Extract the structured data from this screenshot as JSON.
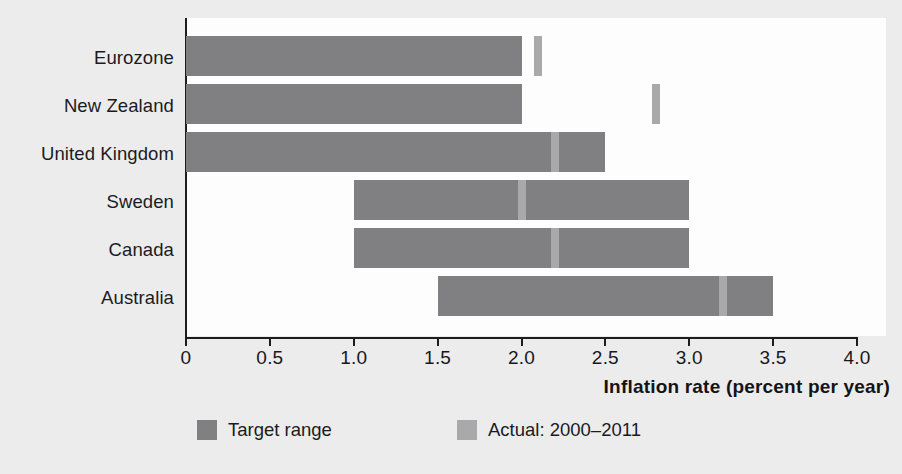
{
  "chart_data": {
    "type": "bar",
    "orientation": "horizontal",
    "title": "",
    "xlabel": "Inflation rate (percent per year)",
    "ylabel": "",
    "xlim": [
      0,
      4.0
    ],
    "xticks": [
      "0",
      "0.5",
      "1.0",
      "1.5",
      "2.0",
      "2.5",
      "3.0",
      "3.5",
      "4.0"
    ],
    "xtick_values": [
      0,
      0.5,
      1.0,
      1.5,
      2.0,
      2.5,
      3.0,
      3.5,
      4.0
    ],
    "grid": false,
    "legend_position": "bottom",
    "categories": [
      "Eurozone",
      "New Zealand",
      "United Kingdom",
      "Sweden",
      "Canada",
      "Australia"
    ],
    "series": [
      {
        "name": "Target range",
        "type": "range",
        "color": "#808082",
        "values": [
          {
            "category": "Eurozone",
            "low": 0.0,
            "high": 2.0
          },
          {
            "category": "New Zealand",
            "low": 0.0,
            "high": 2.0
          },
          {
            "category": "United Kingdom",
            "low": 0.0,
            "high": 2.5
          },
          {
            "category": "Sweden",
            "low": 1.0,
            "high": 3.0
          },
          {
            "category": "Canada",
            "low": 1.0,
            "high": 3.0
          },
          {
            "category": "Australia",
            "low": 1.5,
            "high": 3.5
          }
        ]
      },
      {
        "name": "Actual: 2000–2011",
        "type": "marker",
        "color": "#a9a9ab",
        "values": [
          {
            "category": "Eurozone",
            "value": 2.1
          },
          {
            "category": "New Zealand",
            "value": 2.8
          },
          {
            "category": "United Kingdom",
            "value": 2.2
          },
          {
            "category": "Sweden",
            "value": 2.0
          },
          {
            "category": "Canada",
            "value": 2.2
          },
          {
            "category": "Australia",
            "value": 3.2
          }
        ]
      }
    ]
  },
  "axis": {
    "x_title": "Inflation rate (percent per year)",
    "ticks": [
      {
        "label": "0",
        "value": 0
      },
      {
        "label": "0.5",
        "value": 0.5
      },
      {
        "label": "1.0",
        "value": 1.0
      },
      {
        "label": "1.5",
        "value": 1.5
      },
      {
        "label": "2.0",
        "value": 2.0
      },
      {
        "label": "2.5",
        "value": 2.5
      },
      {
        "label": "3.0",
        "value": 3.0
      },
      {
        "label": "3.5",
        "value": 3.5
      },
      {
        "label": "4.0",
        "value": 4.0
      }
    ]
  },
  "categories": [
    {
      "label": "Eurozone"
    },
    {
      "label": "New Zealand"
    },
    {
      "label": "United Kingdom"
    },
    {
      "label": "Sweden"
    },
    {
      "label": "Canada"
    },
    {
      "label": "Australia"
    }
  ],
  "legend": {
    "target": {
      "label": "Target range",
      "color": "#808082"
    },
    "actual": {
      "label": "Actual: 2000–2011",
      "color": "#a9a9ab"
    }
  }
}
